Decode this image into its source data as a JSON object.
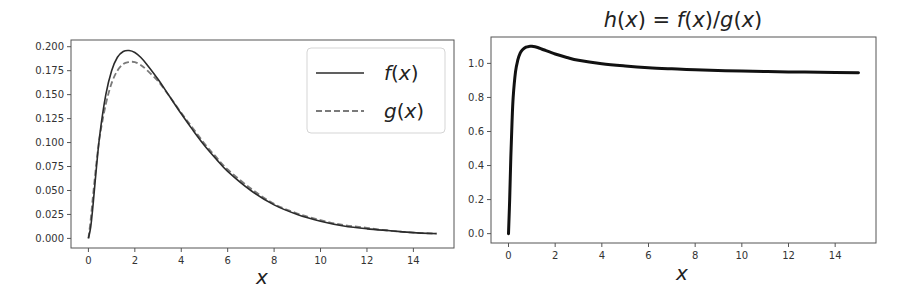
{
  "chart_data": [
    {
      "type": "line",
      "title": "",
      "xlabel": "x",
      "ylabel": "",
      "xlim": [
        -0.75,
        15.75
      ],
      "ylim": [
        -0.01,
        0.207
      ],
      "xticks": [
        0,
        2,
        4,
        6,
        8,
        10,
        12,
        14
      ],
      "xtick_labels": [
        "0",
        "2",
        "4",
        "6",
        "8",
        "10",
        "12",
        "14"
      ],
      "yticks": [
        0.0,
        0.025,
        0.05,
        0.075,
        0.1,
        0.125,
        0.15,
        0.175,
        0.2
      ],
      "ytick_labels": [
        "0.000",
        "0.025",
        "0.050",
        "0.075",
        "0.100",
        "0.125",
        "0.150",
        "0.175",
        "0.200"
      ],
      "grid": false,
      "legend_position": "upper right",
      "x": [
        0,
        0.1,
        0.2,
        0.35,
        0.5,
        0.75,
        1.0,
        1.25,
        1.5,
        1.75,
        2.0,
        2.25,
        2.5,
        3.0,
        3.5,
        4.0,
        4.5,
        5.0,
        5.5,
        6.0,
        7.0,
        8.0,
        9.0,
        10.0,
        11.0,
        12.0,
        13.0,
        14.0,
        15.0
      ],
      "series": [
        {
          "name": "f(x)",
          "label": "f(x)",
          "style": "solid",
          "color": "#2b2b2b",
          "values": [
            0.0,
            0.012,
            0.035,
            0.075,
            0.11,
            0.15,
            0.175,
            0.189,
            0.195,
            0.196,
            0.194,
            0.189,
            0.182,
            0.166,
            0.148,
            0.13,
            0.113,
            0.097,
            0.083,
            0.07,
            0.05,
            0.035,
            0.025,
            0.018,
            0.013,
            0.01,
            0.008,
            0.006,
            0.005
          ]
        },
        {
          "name": "g(x)",
          "label": "g(x)",
          "style": "dashed",
          "color": "#7a7a7a",
          "values": [
            0.0,
            0.02,
            0.045,
            0.08,
            0.108,
            0.14,
            0.162,
            0.175,
            0.182,
            0.184,
            0.184,
            0.181,
            0.176,
            0.164,
            0.148,
            0.131,
            0.115,
            0.099,
            0.085,
            0.072,
            0.052,
            0.036,
            0.026,
            0.019,
            0.014,
            0.011,
            0.008,
            0.006,
            0.005
          ]
        }
      ]
    },
    {
      "type": "line",
      "title": "h(x) = f(x)/g(x)",
      "xlabel": "x",
      "ylabel": "",
      "xlim": [
        -0.75,
        15.75
      ],
      "ylim": [
        -0.055,
        1.155
      ],
      "xticks": [
        0,
        2,
        4,
        6,
        8,
        10,
        12,
        14
      ],
      "xtick_labels": [
        "0",
        "2",
        "4",
        "6",
        "8",
        "10",
        "12",
        "14"
      ],
      "yticks": [
        0.0,
        0.2,
        0.4,
        0.6,
        0.8,
        1.0
      ],
      "ytick_labels": [
        "0.0",
        "0.2",
        "0.4",
        "0.6",
        "0.8",
        "1.0"
      ],
      "grid": false,
      "x": [
        0,
        0.05,
        0.1,
        0.15,
        0.2,
        0.3,
        0.4,
        0.5,
        0.6,
        0.75,
        0.9,
        1.0,
        1.25,
        1.5,
        2.0,
        2.5,
        3.0,
        4.0,
        5.0,
        6.0,
        7.0,
        8.0,
        10.0,
        12.0,
        14.0,
        15.0
      ],
      "series": [
        {
          "name": "h(x)",
          "style": "solid",
          "color": "#111111",
          "values": [
            0.0,
            0.2,
            0.45,
            0.65,
            0.8,
            0.95,
            1.02,
            1.06,
            1.08,
            1.095,
            1.1,
            1.1,
            1.093,
            1.08,
            1.055,
            1.035,
            1.018,
            0.998,
            0.985,
            0.975,
            0.968,
            0.962,
            0.955,
            0.95,
            0.947,
            0.945
          ]
        }
      ]
    }
  ],
  "left_plot": {
    "xlabel": "x",
    "legend": [
      {
        "label": "f(x)",
        "style": "solid"
      },
      {
        "label": "g(x)",
        "style": "dashed"
      }
    ],
    "yticks": [
      "0.000",
      "0.025",
      "0.050",
      "0.075",
      "0.100",
      "0.125",
      "0.150",
      "0.175",
      "0.200"
    ],
    "xticks": [
      "0",
      "2",
      "4",
      "6",
      "8",
      "10",
      "12",
      "14"
    ]
  },
  "right_plot": {
    "title": "h(x) = f(x)/g(x)",
    "xlabel": "x",
    "yticks": [
      "0.0",
      "0.2",
      "0.4",
      "0.6",
      "0.8",
      "1.0"
    ],
    "xticks": [
      "0",
      "2",
      "4",
      "6",
      "8",
      "10",
      "12",
      "14"
    ]
  }
}
